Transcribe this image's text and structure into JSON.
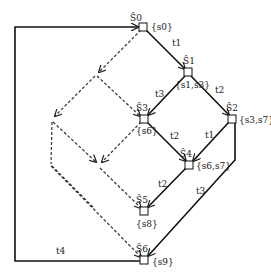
{
  "diagram": {
    "type": "state lattice / transition diagram",
    "nodes": [
      {
        "id": "S0",
        "name": "Ŝ0",
        "set": "{s0}",
        "x": 143,
        "y": 27
      },
      {
        "id": "S1",
        "name": "Ŝ1",
        "set": "{s1,s3}",
        "x": 188,
        "y": 72
      },
      {
        "id": "S3",
        "name": "Ŝ3",
        "set": "{s6}",
        "x": 144,
        "y": 119
      },
      {
        "id": "S2",
        "name": "Ŝ2",
        "set": "{s3,s7}",
        "x": 232,
        "y": 119
      },
      {
        "id": "S4",
        "name": "Ŝ4",
        "set": "{s6,s7}",
        "x": 189,
        "y": 165
      },
      {
        "id": "S5",
        "name": "Ŝ5",
        "set": "{s8}",
        "x": 144,
        "y": 211
      },
      {
        "id": "S6",
        "name": "Ŝ6",
        "set": "{s9}",
        "x": 144,
        "y": 260
      }
    ],
    "edges": [
      {
        "from": "S0",
        "to": "S1",
        "label": "t1",
        "style": "solid"
      },
      {
        "from": "S1",
        "to": "S3",
        "label": "t3",
        "style": "solid"
      },
      {
        "from": "S1",
        "to": "S2",
        "label": "t2",
        "style": "solid"
      },
      {
        "from": "S3",
        "to": "S4",
        "label": "t2",
        "style": "solid"
      },
      {
        "from": "S2",
        "to": "S4",
        "label": "t1",
        "style": "solid"
      },
      {
        "from": "S4",
        "to": "S5",
        "label": "t2",
        "style": "solid"
      },
      {
        "from": "S2",
        "to": "S6",
        "label": "t3",
        "style": "solid"
      },
      {
        "from": "S6",
        "to": "S0",
        "label": "t4",
        "style": "solid-loop"
      }
    ],
    "labels": {
      "t1": "t1",
      "t2": "t2",
      "t3": "t3",
      "t4": "t4"
    }
  }
}
